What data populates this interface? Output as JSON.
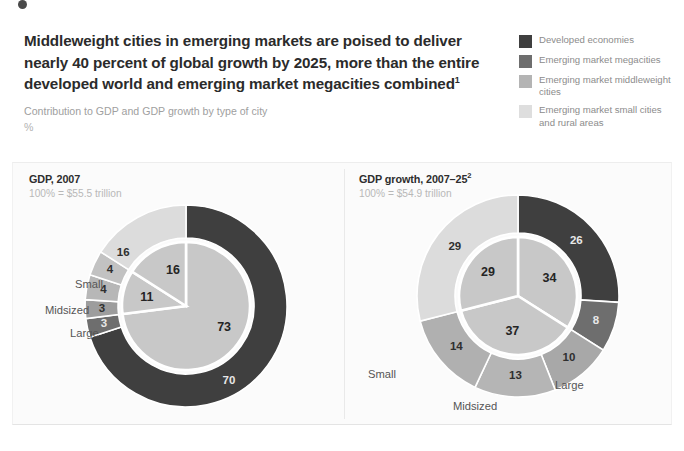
{
  "header": {
    "headline": "Middleweight cities in emerging markets are poised to deliver nearly 40 percent of global growth by 2025, more than the entire developed world and emerging market megacities combined",
    "headline_footnote": "1",
    "subhead": "Contribution to GDP and GDP growth by type of city",
    "units": "%"
  },
  "legend": {
    "items": [
      {
        "label": "Developed economies",
        "color": "#3f3f3f"
      },
      {
        "label": "Emerging market megacities",
        "color": "#6e6e6e"
      },
      {
        "label": "Emerging market middleweight cities",
        "color": "#b4b4b4"
      },
      {
        "label": "Emerging market small cities and rural areas",
        "color": "#dedede"
      }
    ]
  },
  "chart_data": [
    {
      "type": "pie",
      "id": "gdp-2007",
      "title": "GDP, 2007",
      "subtitle": "100% = $55.5 trillion",
      "outer_ring": {
        "categories": [
          "Developed economies",
          "Emerging market megacities",
          "Emerging market middleweight cities – Large",
          "Emerging market middleweight cities – Midsized",
          "Emerging market middleweight cities – Small",
          "Emerging market small cities and rural areas"
        ],
        "values": [
          70,
          3,
          3,
          4,
          4,
          16
        ],
        "colors": [
          "#3f3f3f",
          "#6e6e6e",
          "#9d9d9d",
          "#b7b7b7",
          "#c2c2c2",
          "#dcdcdc"
        ]
      },
      "inner_pie": {
        "categories": [
          "Developed economies",
          "Emerging market middleweight cities",
          "Emerging market small cities and rural areas"
        ],
        "values": [
          73,
          11,
          16
        ],
        "colors": [
          "#c8c8c8",
          "#c8c8c8",
          "#c8c8c8"
        ]
      },
      "annotations": [
        "Small",
        "Midsized",
        "Large"
      ]
    },
    {
      "type": "pie",
      "id": "gdp-growth-2007-25",
      "title": "GDP growth, 2007–25",
      "title_footnote": "2",
      "subtitle": "100% = $54.9 trillion",
      "outer_ring": {
        "categories": [
          "Developed economies",
          "Emerging market megacities",
          "Emerging market middleweight cities – Large",
          "Emerging market middleweight cities – Midsized",
          "Emerging market middleweight cities – Small",
          "Emerging market small cities and rural areas"
        ],
        "values": [
          26,
          8,
          10,
          13,
          14,
          29
        ],
        "colors": [
          "#3f3f3f",
          "#6e6e6e",
          "#a8a8a8",
          "#b5b5b5",
          "#b0b0b0",
          "#dcdcdc"
        ]
      },
      "inner_pie": {
        "categories": [
          "Developed economies",
          "Emerging market middleweight cities",
          "Emerging market small cities and rural areas"
        ],
        "values": [
          34,
          37,
          29
        ],
        "colors": [
          "#c8c8c8",
          "#c8c8c8",
          "#c8c8c8"
        ]
      },
      "annotations": [
        "Small",
        "Midsized",
        "Large"
      ]
    }
  ],
  "left_chart": {
    "title": "GDP, 2007",
    "subtitle": "100% = $55.5 trillion",
    "labels": {
      "small": "Small",
      "midsized": "Midsized",
      "large": "Large"
    }
  },
  "right_chart": {
    "title": "GDP growth, 2007–25",
    "title_footnote": "2",
    "subtitle": "100% = $54.9 trillion",
    "labels": {
      "small": "Small",
      "midsized": "Midsized",
      "large": "Large"
    }
  }
}
